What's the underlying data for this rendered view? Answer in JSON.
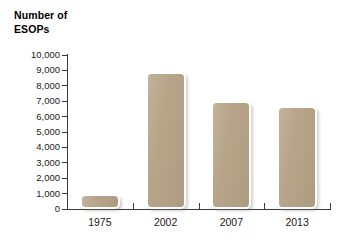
{
  "chart_data": {
    "type": "bar",
    "title": "Number of\nESOPs",
    "xlabel": "",
    "ylabel": "",
    "categories": [
      "1975",
      "2002",
      "2007",
      "2013"
    ],
    "values": [
      1000,
      8900,
      7000,
      6700
    ],
    "ylim": [
      0,
      10000
    ],
    "ytick_labels": [
      "10,000",
      "9,000",
      "8,000",
      "7,000",
      "6,000",
      "5,000",
      "4,000",
      "3,000",
      "2,000",
      "1,000",
      "0"
    ],
    "ytick_values": [
      10000,
      9000,
      8000,
      7000,
      6000,
      5000,
      4000,
      3000,
      2000,
      1000,
      0
    ],
    "grid": false,
    "legend": null,
    "bar_color": "#b7a489",
    "bar_outline_color": "#ffffff",
    "axis_color": "#3a3a3a",
    "background_color": "#ffffff",
    "text_color": "#1a1a1a"
  }
}
